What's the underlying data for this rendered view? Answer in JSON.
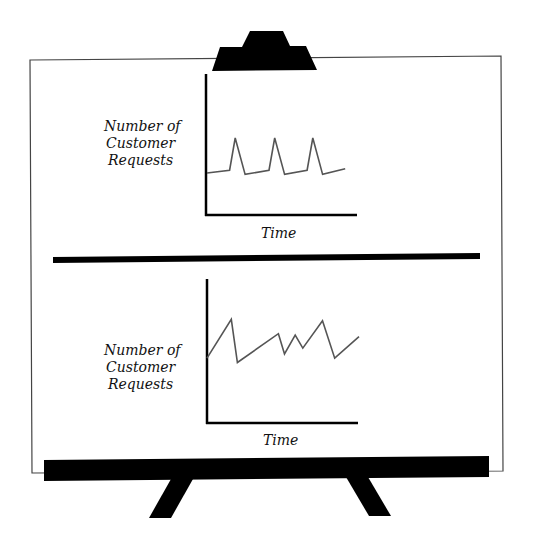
{
  "colors": {
    "ink": "#000000",
    "line": "#555555",
    "board": "#ffffff"
  },
  "charts": [
    {
      "name": "top",
      "ylabel": [
        "Number of",
        "Customer",
        "Requests"
      ],
      "xlabel": "Time",
      "pattern": "periodic spikes on a steady baseline",
      "series": [
        [
          0,
          0.3
        ],
        [
          0.16,
          0.32
        ],
        [
          0.2,
          0.55
        ],
        [
          0.27,
          0.29
        ],
        [
          0.44,
          0.32
        ],
        [
          0.48,
          0.55
        ],
        [
          0.55,
          0.29
        ],
        [
          0.71,
          0.32
        ],
        [
          0.75,
          0.55
        ],
        [
          0.82,
          0.29
        ],
        [
          0.98,
          0.33
        ]
      ]
    },
    {
      "name": "bottom",
      "ylabel": [
        "Number of",
        "Customer",
        "Requests"
      ],
      "xlabel": "Time",
      "pattern": "irregular fluctuating requests",
      "series": [
        [
          0,
          0.45
        ],
        [
          0.16,
          0.72
        ],
        [
          0.2,
          0.42
        ],
        [
          0.47,
          0.62
        ],
        [
          0.51,
          0.48
        ],
        [
          0.58,
          0.61
        ],
        [
          0.63,
          0.52
        ],
        [
          0.76,
          0.71
        ],
        [
          0.84,
          0.45
        ],
        [
          1.0,
          0.6
        ]
      ]
    }
  ]
}
